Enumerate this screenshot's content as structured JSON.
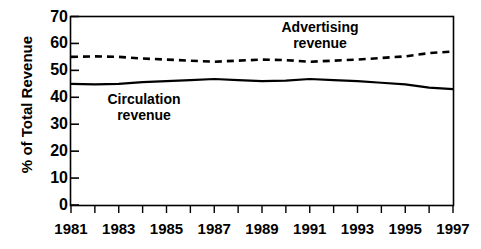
{
  "chart_data": {
    "type": "line",
    "title": "",
    "xlabel": "",
    "ylabel": "% of Total Revenue",
    "xlim": [
      1981,
      1997
    ],
    "ylim": [
      0,
      70
    ],
    "yticks": [
      0,
      10,
      20,
      30,
      40,
      50,
      60,
      70
    ],
    "ytick_labels": [
      "0",
      "10",
      "20",
      "30",
      "40",
      "50",
      "60",
      "70"
    ],
    "xticks": [
      1981,
      1982,
      1983,
      1984,
      1985,
      1986,
      1987,
      1988,
      1989,
      1990,
      1991,
      1992,
      1993,
      1994,
      1995,
      1996,
      1997
    ],
    "xtick_labels": [
      "1981",
      "",
      "1983",
      "",
      "1985",
      "",
      "1987",
      "",
      "1989",
      "",
      "1991",
      "",
      "1993",
      "",
      "1995",
      "",
      "1997"
    ],
    "xtick_labels_shown": [
      "1981",
      "1983",
      "1985",
      "1987",
      "1989",
      "1991",
      "1993",
      "1995",
      "1997"
    ],
    "x": [
      1981,
      1982,
      1983,
      1984,
      1985,
      1986,
      1987,
      1988,
      1989,
      1990,
      1991,
      1992,
      1993,
      1994,
      1995,
      1996,
      1997
    ],
    "grid": false,
    "legend_position": "inline-annotations",
    "series": [
      {
        "name": "Advertising revenue",
        "style": "dashed",
        "color": "#000000",
        "values": [
          55.0,
          55.2,
          55.0,
          54.4,
          54.0,
          53.6,
          53.2,
          53.6,
          54.0,
          53.8,
          53.2,
          53.6,
          54.0,
          54.6,
          55.2,
          56.4,
          57.0
        ]
      },
      {
        "name": "Circulation revenue",
        "style": "solid",
        "color": "#000000",
        "values": [
          45.0,
          44.8,
          45.0,
          45.6,
          46.0,
          46.4,
          46.8,
          46.4,
          46.0,
          46.2,
          46.8,
          46.4,
          46.0,
          45.4,
          44.8,
          43.6,
          43.0
        ]
      }
    ],
    "annotations": [
      {
        "text": "Advertising revenue",
        "line1": "Advertising",
        "line2": "revenue"
      },
      {
        "text": "Circulation revenue",
        "line1": "Circulation",
        "line2": "revenue"
      }
    ]
  },
  "axes": {
    "y_title": "% of Total Revenue"
  },
  "annotations": {
    "advertising_line1": "Advertising",
    "advertising_line2": "revenue",
    "circulation_line1": "Circulation",
    "circulation_line2": "revenue"
  }
}
